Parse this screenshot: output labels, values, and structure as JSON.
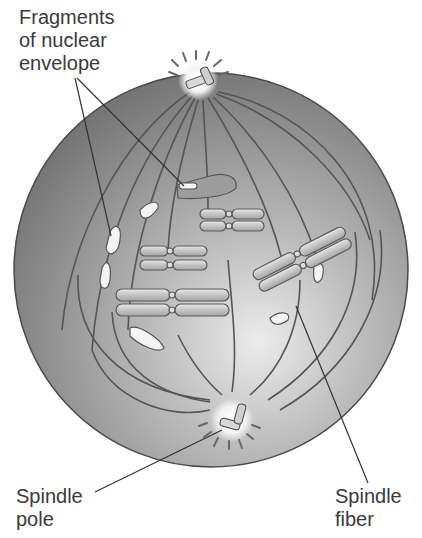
{
  "diagram": {
    "labels": {
      "fragments": "Fragments\nof nuclear\nenvelope",
      "spindle_pole": "Spindle\npole",
      "spindle_fiber": "Spindle\nfiber"
    },
    "colors": {
      "cell_fill_dark": "#7d7d7d",
      "cell_fill_light": "#e6e6e6",
      "outline": "#4a4a4a",
      "chromosome": "#cfcfcf",
      "label_text": "#3a3a3a"
    }
  }
}
